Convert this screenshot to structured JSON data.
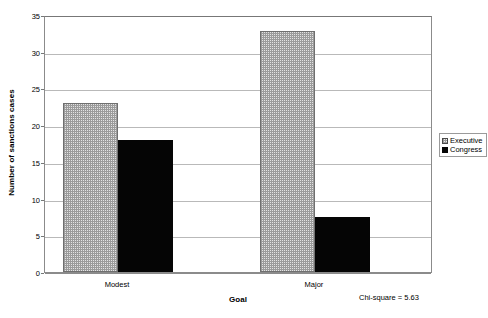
{
  "chart_data": {
    "type": "bar",
    "title": "",
    "xlabel": "Goal",
    "ylabel": "Number of sanctions cases",
    "categories": [
      "Modest",
      "Major"
    ],
    "series": [
      {
        "name": "Executive",
        "values": [
          23,
          32.8
        ],
        "swatch": "dotted-light-gray",
        "color": "#e3e3e3"
      },
      {
        "name": "Congress",
        "values": [
          18,
          7.5
        ],
        "swatch": "solid-black",
        "color": "#050505"
      }
    ],
    "ylim": [
      0,
      35
    ],
    "yticks": [
      0,
      5,
      10,
      15,
      20,
      25,
      30,
      35
    ],
    "ytick_labels": [
      "0",
      "5",
      "10",
      "15",
      "20",
      "25",
      "30",
      "35"
    ],
    "grid": true,
    "grid_axis": "y",
    "legend_position": "right-middle",
    "annotations": [
      {
        "text": "Chi-square = 5.63"
      }
    ]
  },
  "legend": {
    "items": [
      {
        "label": "Executive"
      },
      {
        "label": "Congress"
      }
    ]
  },
  "annotation": {
    "chi_square_text": "Chi-square = 5.63"
  }
}
